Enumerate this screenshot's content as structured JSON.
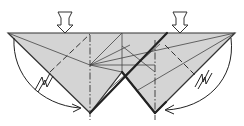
{
  "diagram": {
    "type": "origami-fold-step",
    "width": 244,
    "height": 126,
    "colors": {
      "paper_fill": "#d4d4d4",
      "line": "#333333",
      "thick_line": "#222222",
      "background": "#ffffff"
    },
    "push_arrows": [
      {
        "id": "left",
        "x": 65,
        "tip_y": 33
      },
      {
        "id": "right",
        "x": 180,
        "tip_y": 33
      }
    ],
    "swing_arrows": [
      {
        "id": "left",
        "direction": "clockwise-down-right"
      },
      {
        "id": "right",
        "direction": "counterclockwise-down-left"
      }
    ],
    "lightning_symbols": 2,
    "fold_lines": {
      "valley_dashed": 2,
      "mountain_dash_dot": 2
    }
  }
}
